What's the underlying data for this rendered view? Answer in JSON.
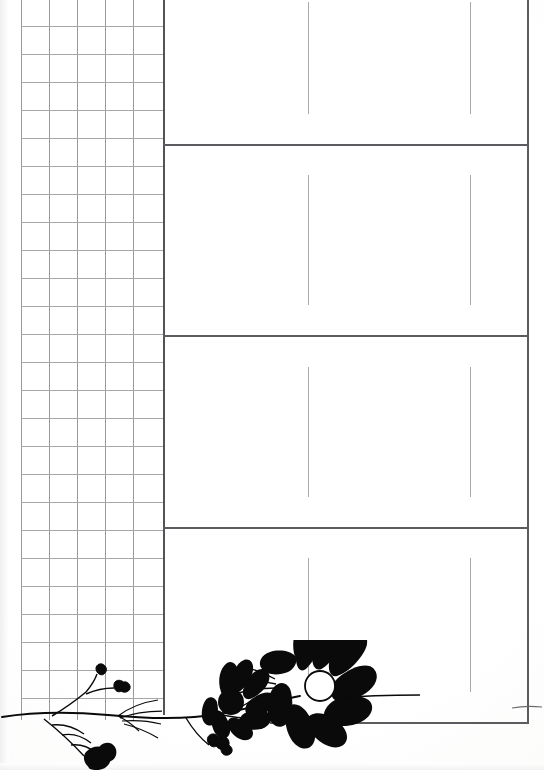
{
  "page": {
    "title": "Blank ruled worksheet page with graph grid and floral border",
    "width": 544,
    "height": 770,
    "background_color": "#ffffff",
    "ink_color": "#000000"
  },
  "grid_panel": {
    "name": "graph-paper-grid",
    "left": 21,
    "top": 0,
    "right": 163,
    "bottom": 720,
    "cell_size": 28,
    "columns": 5,
    "rows": 26,
    "line_color": "#9a9a9c",
    "border_color": "#535357",
    "vertical_lines_x": [
      21,
      49,
      77,
      105,
      133,
      163
    ],
    "horizontal_lines_y": [
      26,
      54,
      82,
      110,
      138,
      166,
      194,
      222,
      250,
      278,
      306,
      334,
      362,
      390,
      418,
      446,
      474,
      502,
      530,
      558,
      586,
      614,
      642,
      670,
      698
    ],
    "label": "Grid"
  },
  "answer_panel": {
    "name": "ruled-answer-boxes",
    "left": 163,
    "right": 527,
    "top": 0,
    "bottom": 722,
    "rule_color": "#5c5c60",
    "divider_color": "#a9a9ad",
    "horizontal_rules_y": [
      144,
      335,
      527,
      722
    ],
    "boxes": [
      {
        "index": 1,
        "label": "Box 1",
        "top": 0,
        "bottom": 144,
        "dividers_x": [
          308,
          470
        ],
        "divider_top": 2,
        "divider_bottom": 114,
        "content": ""
      },
      {
        "index": 2,
        "label": "Box 2",
        "top": 144,
        "bottom": 335,
        "dividers_x": [
          308,
          470
        ],
        "divider_top": 175,
        "divider_bottom": 305,
        "content": ""
      },
      {
        "index": 3,
        "label": "Box 3",
        "top": 335,
        "bottom": 527,
        "dividers_x": [
          308,
          470
        ],
        "divider_top": 367,
        "divider_bottom": 497,
        "content": ""
      },
      {
        "index": 4,
        "label": "Box 4",
        "top": 527,
        "bottom": 722,
        "dividers_x": [
          308,
          470
        ],
        "divider_top": 558,
        "divider_bottom": 692,
        "content": ""
      }
    ],
    "bottom_rule": {
      "x_start": 270,
      "x_end": 527,
      "y": 722
    }
  },
  "decoration": {
    "name": "floral-border-silhouette",
    "description": "Black silhouette of a flowering stem running along the bottom edge",
    "ink_color": "#000000",
    "elements": [
      {
        "name": "stem",
        "type": "curved-line"
      },
      {
        "name": "large-flower",
        "type": "daisy",
        "center_fill": "#ffffff"
      },
      {
        "name": "medium-flower",
        "type": "daisy"
      },
      {
        "name": "small-bud-left",
        "type": "bud"
      },
      {
        "name": "small-bud-right",
        "type": "bud"
      },
      {
        "name": "leaf-cluster",
        "type": "leaves"
      }
    ]
  }
}
